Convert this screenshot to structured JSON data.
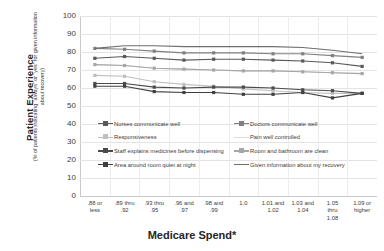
{
  "axis": {
    "y_title_main": "Patient Experience",
    "y_title_sub": "(% of patients indicating “always” or “yes” for given information about recovery)",
    "x_title": "Medicare Spend*",
    "y_ticks": [
      "100",
      "90",
      "80",
      "70",
      "60",
      "50",
      "40",
      "30",
      "20",
      "10",
      "0"
    ]
  },
  "chart_data": {
    "type": "line",
    "title": "",
    "xlabel": "Medicare Spend*",
    "ylabel": "Patient Experience (% of patients indicating “always” or “yes” for given information about recovery)",
    "ylim": [
      0,
      100
    ],
    "ytick_step": 10,
    "grid": true,
    "legend_position": "inside-lower-center",
    "categories": [
      ".88 or less",
      ".89 thru .92",
      ".93 thru .95",
      ".96 and .97",
      ".98 and .99",
      "1.0",
      "1.01 and 1.02",
      "1.03 and 1.04",
      "1.05 thru 1.08",
      "1.09 or higher"
    ],
    "category_lines": [
      [
        ".88 or",
        "less"
      ],
      [
        ".89 thru",
        ".92"
      ],
      [
        ".93 thru",
        ".95"
      ],
      [
        ".96 and",
        ".97"
      ],
      [
        ".98 and",
        ".99"
      ],
      [
        "1.0"
      ],
      [
        "1.01 and",
        "1.02"
      ],
      [
        "1.03 and",
        "1.04"
      ],
      [
        "1.05",
        "thru",
        "1.08"
      ],
      [
        "1.09 or",
        "higher"
      ]
    ],
    "series": [
      {
        "name": "Nurses communicate well",
        "color": "#595959",
        "marker": "square",
        "values": [
          76.5,
          77.5,
          76.5,
          75.5,
          76.0,
          76.0,
          75.5,
          75.0,
          74.0,
          72.0
        ]
      },
      {
        "name": "Doctors communicate well",
        "color": "#808080",
        "marker": "square",
        "values": [
          82.0,
          81.5,
          80.5,
          79.5,
          79.5,
          79.5,
          79.0,
          79.0,
          78.0,
          77.0
        ]
      },
      {
        "name": "Responsiveness",
        "color": "#bfbfbf",
        "marker": "square",
        "values": [
          67.0,
          66.5,
          63.5,
          62.0,
          61.0,
          59.5,
          58.5,
          57.5,
          57.0,
          57.0
        ]
      },
      {
        "name": "Pain well controlled",
        "color": "#d9d9d9",
        "marker": "none",
        "values": [
          73.0,
          72.5,
          71.0,
          70.5,
          70.0,
          69.5,
          69.5,
          69.0,
          68.5,
          68.0
        ]
      },
      {
        "name": "Staff explains medicines before dispensing",
        "color": "#4a4a4a",
        "marker": "square",
        "values": [
          62.5,
          62.5,
          60.5,
          60.0,
          60.5,
          60.5,
          60.0,
          59.0,
          58.5,
          57.0
        ]
      },
      {
        "name": "Room and bathroom are clean",
        "color": "#a6a6a6",
        "marker": "square",
        "values": [
          73.0,
          72.5,
          71.0,
          70.5,
          70.0,
          69.5,
          69.5,
          69.0,
          68.5,
          68.0
        ]
      },
      {
        "name": "Area around room quiet at night",
        "color": "#404040",
        "marker": "square",
        "values": [
          61.0,
          61.0,
          58.0,
          57.5,
          57.5,
          56.5,
          56.5,
          57.5,
          54.5,
          57.0
        ]
      },
      {
        "name": "Given information about my recovery",
        "color": "#6e6e6e",
        "marker": "none",
        "values": [
          82.0,
          83.5,
          83.5,
          83.0,
          83.0,
          83.0,
          83.0,
          82.5,
          81.0,
          79.0
        ]
      }
    ]
  },
  "legend": {
    "items": [
      {
        "label": "Nurses communicate well",
        "color": "#595959",
        "marker": "square"
      },
      {
        "label": "Doctors communicate well",
        "color": "#808080",
        "marker": "square"
      },
      {
        "label": "Responsiveness",
        "color": "#bfbfbf",
        "marker": "square"
      },
      {
        "label": "Pain well controlled",
        "color": "#d9d9d9",
        "marker": "none"
      },
      {
        "label": "Staff explains medicines before dispensing",
        "color": "#4a4a4a",
        "marker": "square"
      },
      {
        "label": "Room and bathroom are clean",
        "color": "#a6a6a6",
        "marker": "square"
      },
      {
        "label": "Area around room quiet at night",
        "color": "#404040",
        "marker": "square"
      },
      {
        "label": "Given information about my recovery",
        "color": "#6e6e6e",
        "marker": "none"
      }
    ]
  }
}
